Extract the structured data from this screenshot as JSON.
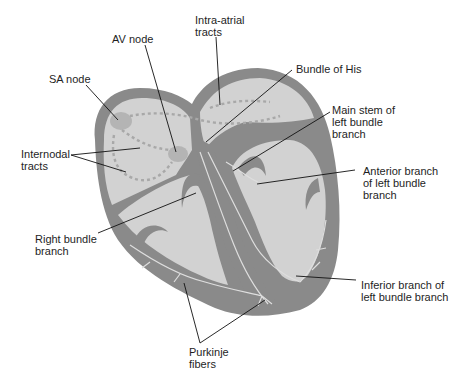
{
  "diagram": {
    "colors": {
      "background": "#ffffff",
      "wall": "#8a8a8a",
      "chamber": "#d2d2d2",
      "node": "#b4b4b4",
      "fiber": "#dedede",
      "tract": "#a8a8a8",
      "leader": "#111111",
      "text": "#1e1e1e"
    },
    "labels": {
      "intra_atrial": "Intra-atrial\ntracts",
      "av_node": "AV node",
      "sa_node": "SA node",
      "bundle_of_his": "Bundle of His",
      "main_stem": "Main stem of\nleft bundle\nbranch",
      "internodal": "Internodal\ntracts",
      "anterior_branch": "Anterior branch\nof left bundle\nbranch",
      "right_bundle": "Right bundle\nbranch",
      "inferior_branch": "Inferior branch of\nleft bundle branch",
      "purkinje": "Purkinje\nfibers"
    }
  }
}
